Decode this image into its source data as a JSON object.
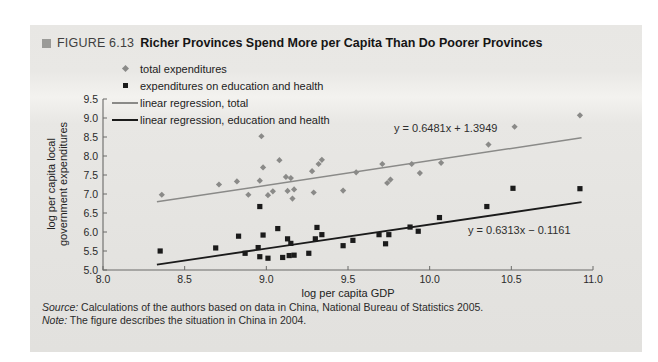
{
  "figure": {
    "label": "FIGURE 6.13",
    "title": "Richer Provinces Spend More per Capita Than Do Poorer Provinces"
  },
  "chart_data": {
    "type": "scatter",
    "xlabel": "log per capita GDP",
    "ylabel": "log per capita local government expenditures",
    "ylabel_lines": [
      "log per capita local",
      "government expenditures"
    ],
    "xlim": [
      8.0,
      11.0
    ],
    "ylim": [
      5.0,
      9.5
    ],
    "xticks": [
      "8.0",
      "8.5",
      "9.0",
      "9.5",
      "10.0",
      "10.5",
      "11.0"
    ],
    "yticks": [
      "5.0",
      "5.5",
      "6.0",
      "6.5",
      "7.0",
      "7.5",
      "8.0",
      "8.5",
      "9.0",
      "9.5"
    ],
    "grid": false,
    "legend_position": "top-left",
    "colors": {
      "total": "#8a8a88",
      "education_health": "#1b1b1b",
      "spine": "#6b6b69"
    },
    "series": [
      {
        "name": "total expenditures",
        "marker": "diamond",
        "points": [
          [
            8.36,
            6.98
          ],
          [
            8.71,
            7.25
          ],
          [
            8.82,
            7.33
          ],
          [
            8.89,
            6.98
          ],
          [
            8.96,
            7.35
          ],
          [
            8.97,
            8.52
          ],
          [
            8.98,
            7.7
          ],
          [
            9.01,
            6.97
          ],
          [
            9.04,
            7.07
          ],
          [
            9.08,
            7.89
          ],
          [
            9.12,
            7.45
          ],
          [
            9.13,
            7.08
          ],
          [
            9.15,
            7.42
          ],
          [
            9.16,
            6.88
          ],
          [
            9.17,
            7.12
          ],
          [
            9.28,
            7.6
          ],
          [
            9.29,
            7.04
          ],
          [
            9.32,
            7.79
          ],
          [
            9.34,
            7.9
          ],
          [
            9.47,
            7.09
          ],
          [
            9.55,
            7.57
          ],
          [
            9.71,
            7.79
          ],
          [
            9.74,
            7.29
          ],
          [
            9.76,
            7.38
          ],
          [
            9.89,
            7.79
          ],
          [
            9.94,
            7.55
          ],
          [
            10.07,
            7.82
          ],
          [
            10.36,
            8.3
          ],
          [
            10.52,
            8.77
          ],
          [
            10.92,
            9.07
          ]
        ]
      },
      {
        "name": "expenditures on education and health",
        "marker": "square",
        "points": [
          [
            8.35,
            5.5
          ],
          [
            8.69,
            5.58
          ],
          [
            8.83,
            5.89
          ],
          [
            8.87,
            5.44
          ],
          [
            8.95,
            5.59
          ],
          [
            8.96,
            6.67
          ],
          [
            8.96,
            5.35
          ],
          [
            8.98,
            5.92
          ],
          [
            9.01,
            5.31
          ],
          [
            9.07,
            6.09
          ],
          [
            9.1,
            5.33
          ],
          [
            9.13,
            5.82
          ],
          [
            9.14,
            5.38
          ],
          [
            9.15,
            5.7
          ],
          [
            9.17,
            5.39
          ],
          [
            9.26,
            5.44
          ],
          [
            9.3,
            5.82
          ],
          [
            9.31,
            6.12
          ],
          [
            9.34,
            5.93
          ],
          [
            9.47,
            5.64
          ],
          [
            9.53,
            5.78
          ],
          [
            9.69,
            5.93
          ],
          [
            9.73,
            5.69
          ],
          [
            9.75,
            5.93
          ],
          [
            9.88,
            6.13
          ],
          [
            9.93,
            6.02
          ],
          [
            10.06,
            6.38
          ],
          [
            10.35,
            6.67
          ],
          [
            10.51,
            7.15
          ],
          [
            10.92,
            7.14
          ]
        ]
      }
    ],
    "regressions": [
      {
        "name": "linear regression, total",
        "series": "total expenditures",
        "slope": 0.6481,
        "intercept": 1.3949,
        "equation": "y = 0.6481x + 1.3949",
        "x_range": [
          8.33,
          10.93
        ]
      },
      {
        "name": "linear regression, education and health",
        "series": "expenditures on education and health",
        "slope": 0.6313,
        "intercept": -0.1161,
        "equation": "y = 0.6313x − 0.1161",
        "x_range": [
          8.33,
          10.93
        ]
      }
    ],
    "legend": [
      {
        "label": "total expenditures",
        "marker": "diamond"
      },
      {
        "label": "expenditures on education and health",
        "marker": "square"
      },
      {
        "label": "linear regression, total",
        "marker": "line-gray"
      },
      {
        "label": "linear regression, education and health",
        "marker": "line-black"
      }
    ]
  },
  "footer": {
    "source_label": "Source:",
    "source_text": " Calculations of the authors based on data in China, National Bureau of Statistics 2005.",
    "note_label": "Note:",
    "note_text": " The figure describes the situation in China in 2004."
  }
}
